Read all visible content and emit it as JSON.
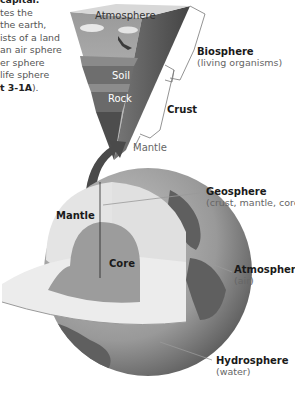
{
  "intro_text": {
    "lines": [
      "capital.",
      "tes the",
      " the earth,",
      "ists of a land",
      "an air sphere",
      "er sphere",
      " life sphere"
    ],
    "figure_ref_bold": "t 3-1A",
    "figure_ref_end": ")."
  },
  "wedge": {
    "atmosphere": "Atmosphere",
    "soil": "Soil",
    "rock": "Rock"
  },
  "labels": {
    "biosphere": {
      "title": "Biosphere",
      "sub": "(living organisms)"
    },
    "crust": {
      "title": "Crust"
    },
    "mantle_top": {
      "title": "Mantle"
    },
    "geosphere": {
      "title": "Geosphere",
      "sub": "(crust, mantle, core)"
    },
    "atmosphere": {
      "title": "Atmosphere",
      "sub": "(air)"
    },
    "hydrosphere": {
      "title": "Hydrosphere",
      "sub": "(water)"
    },
    "mantle_inner": {
      "title": "Mantle"
    },
    "core": {
      "title": "Core"
    }
  },
  "colors": {
    "sky": "#b8b8b8",
    "soil": "#6e6e6e",
    "rock": "#5a5a5a",
    "mantle": "#e6e6e6",
    "core": "#9a9a9a",
    "ocean": "#a8a8a8",
    "land": "#6a6a6a"
  }
}
